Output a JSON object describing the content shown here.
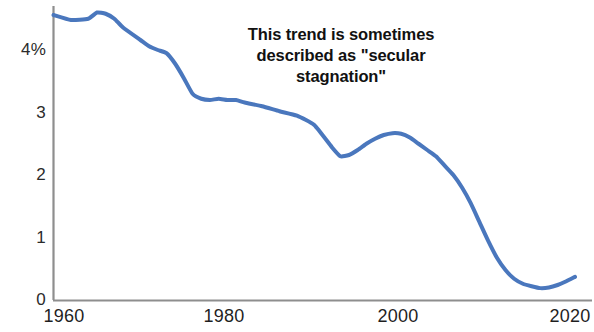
{
  "chart_data": {
    "type": "line",
    "title": "",
    "subtitle": "",
    "xlabel": "",
    "ylabel": "",
    "xlim": [
      1960,
      2021
    ],
    "ylim": [
      0,
      4.8
    ],
    "grid": false,
    "legend": false,
    "legend_position": "none",
    "line_color": "#4a77bd",
    "line_width_px": 4,
    "axis_color": "#8c8c8c",
    "annotations": [
      {
        "name": "secular-stagnation-note",
        "lines": [
          "This trend is sometimes",
          "described as \"secular",
          "stagnation\""
        ],
        "x": 1997,
        "y": 4.1,
        "bold": true,
        "align": "center"
      }
    ],
    "yaxis": {
      "ticks": [
        0,
        1,
        2,
        3,
        4
      ],
      "tick_labels": [
        "0",
        "1",
        "2",
        "3",
        "4%"
      ],
      "unit": "%"
    },
    "xaxis": {
      "ticks": [
        1960,
        1980,
        2000,
        2020
      ],
      "tick_labels": [
        "1960",
        "1980",
        "2000",
        "2020"
      ]
    },
    "series": [
      {
        "name": "trend",
        "color": "#4a77bd",
        "x": [
          1960,
          1962,
          1964,
          1965,
          1966,
          1967,
          1968,
          1970,
          1971,
          1972,
          1973,
          1974,
          1975,
          1976,
          1977,
          1978,
          1979,
          1980,
          1981,
          1982,
          1984,
          1986,
          1988,
          1990,
          1992,
          1993,
          1994,
          1995,
          1996,
          1997,
          1998,
          1999,
          2000,
          2001,
          2002,
          2003,
          2004,
          2005,
          2006,
          2007,
          2008,
          2009,
          2010,
          2011,
          2012,
          2013,
          2014,
          2015,
          2016,
          2017,
          2018,
          2019,
          2020
        ],
        "y": [
          4.56,
          4.48,
          4.5,
          4.6,
          4.58,
          4.5,
          4.36,
          4.16,
          4.06,
          4.0,
          3.95,
          3.78,
          3.55,
          3.3,
          3.22,
          3.2,
          3.22,
          3.2,
          3.2,
          3.16,
          3.1,
          3.02,
          2.95,
          2.8,
          2.45,
          2.3,
          2.32,
          2.4,
          2.5,
          2.58,
          2.64,
          2.67,
          2.66,
          2.6,
          2.5,
          2.4,
          2.3,
          2.15,
          2.0,
          1.8,
          1.55,
          1.25,
          0.95,
          0.68,
          0.48,
          0.34,
          0.26,
          0.22,
          0.19,
          0.2,
          0.24,
          0.3,
          0.37
        ]
      }
    ]
  },
  "axes": {
    "y_labels": [
      "4%",
      "3",
      "2",
      "1",
      "0"
    ],
    "x_labels": [
      "1960",
      "1980",
      "2000",
      "2020"
    ]
  },
  "annotation": {
    "line1": "This trend is sometimes",
    "line2": "described as \"secular",
    "line3": "stagnation\""
  }
}
